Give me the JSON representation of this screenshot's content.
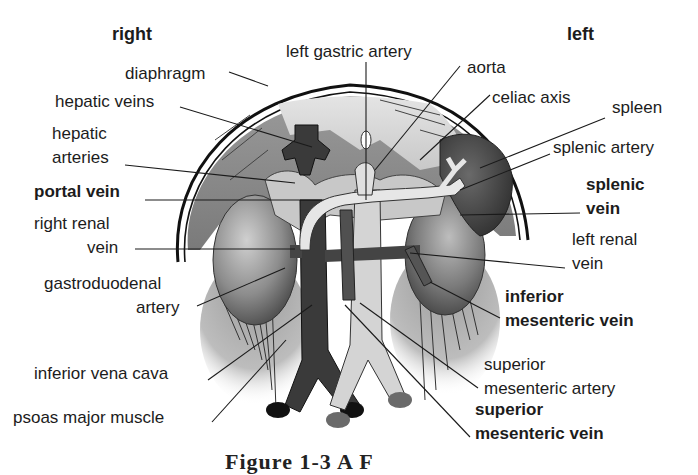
{
  "figure": {
    "orientation": {
      "right": "right",
      "left": "left"
    },
    "labels": {
      "left_gastric_artery": "left gastric artery",
      "diaphragm": "diaphragm",
      "aorta": "aorta",
      "hepatic_veins": "hepatic veins",
      "celiac_axis": "celiac axis",
      "spleen": "spleen",
      "hepatic_arteries_1": "hepatic",
      "hepatic_arteries_2": "arteries",
      "splenic_artery": "splenic artery",
      "portal_vein": "portal vein",
      "splenic_vein_1": "splenic",
      "splenic_vein_2": "vein",
      "right_renal_vein_1": "right renal",
      "right_renal_vein_2": "vein",
      "left_renal_vein_1": "left renal",
      "left_renal_vein_2": "vein",
      "gastroduodenal_artery_1": "gastroduodenal",
      "gastroduodenal_artery_2": "artery",
      "inferior_mesenteric_vein_1": "inferior",
      "inferior_mesenteric_vein_2": "mesenteric vein",
      "inferior_vena_cava": "inferior vena cava",
      "superior_mesenteric_artery_1": "superior",
      "superior_mesenteric_artery_2": "mesenteric artery",
      "psoas_major_muscle": "psoas major muscle",
      "superior_mesenteric_vein_1": "superior",
      "superior_mesenteric_vein_2": "mesenteric vein"
    },
    "caption": "Figure 1-3   A   F"
  },
  "colors": {
    "background": "#ffffff",
    "text": "#1c1c1c",
    "dark_vessel": "#3a3a3a",
    "light_vessel": "#d8d8d8",
    "organ_mid": "#8a8a8a",
    "organ_light": "#c4c4c4"
  }
}
